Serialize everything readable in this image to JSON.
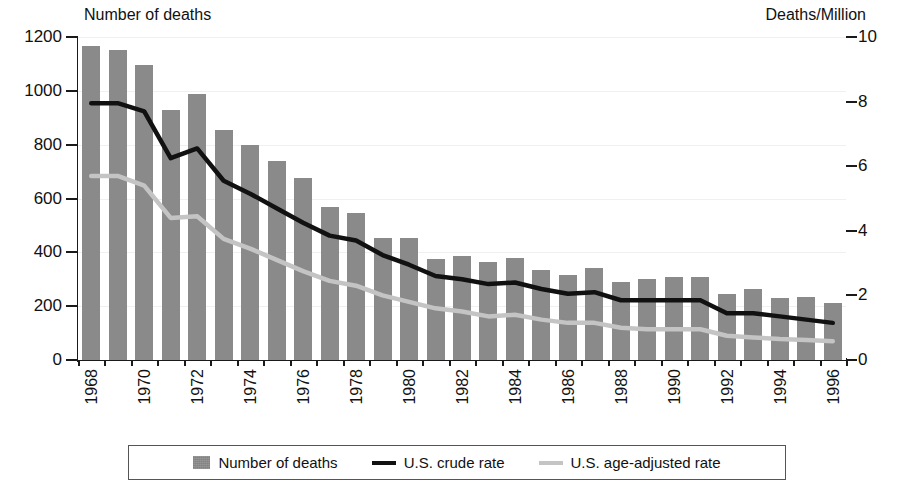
{
  "chart_data": {
    "type": "bar",
    "title": "",
    "left_axis_title": "Number of deaths",
    "right_axis_title": "Deaths/Million",
    "xlabel": "",
    "ylabel": "Number of deaths",
    "y2label": "Deaths/Million",
    "ylim": [
      0,
      1200
    ],
    "y2lim": [
      0,
      10
    ],
    "yticks": [
      0,
      200,
      400,
      600,
      800,
      1000,
      1200
    ],
    "y2ticks": [
      0,
      2,
      4,
      6,
      8,
      10
    ],
    "grid": false,
    "legend_position": "bottom",
    "categories": [
      "1968",
      "1969",
      "1970",
      "1971",
      "1972",
      "1973",
      "1974",
      "1975",
      "1976",
      "1977",
      "1978",
      "1979",
      "1980",
      "1981",
      "1982",
      "1983",
      "1984",
      "1985",
      "1986",
      "1987",
      "1988",
      "1989",
      "1990",
      "1991",
      "1992",
      "1993",
      "1994",
      "1995",
      "1996"
    ],
    "xtick_labels": [
      "1968",
      "1970",
      "1972",
      "1974",
      "1976",
      "1978",
      "1980",
      "1982",
      "1984",
      "1986",
      "1988",
      "1990",
      "1992",
      "1994",
      "1996"
    ],
    "series": [
      {
        "name": "Number of deaths",
        "type": "bar",
        "axis": "left",
        "color": "#8a8a8a",
        "values": [
          1165,
          1150,
          1095,
          930,
          990,
          855,
          800,
          740,
          675,
          570,
          545,
          455,
          455,
          375,
          385,
          365,
          380,
          335,
          315,
          340,
          290,
          300,
          310,
          310,
          245,
          265,
          230,
          235,
          210
        ]
      },
      {
        "name": "U.S. crude rate",
        "type": "line",
        "axis": "right",
        "color": "#111111",
        "values": [
          7.95,
          7.95,
          7.7,
          6.25,
          6.55,
          5.55,
          5.15,
          4.7,
          4.25,
          3.85,
          3.7,
          3.25,
          2.95,
          2.6,
          2.5,
          2.35,
          2.4,
          2.2,
          2.05,
          2.1,
          1.85,
          1.85,
          1.85,
          1.85,
          1.45,
          1.45,
          1.35,
          1.25,
          1.15
        ]
      },
      {
        "name": "U.S. age-adjusted rate",
        "type": "line",
        "axis": "right",
        "color": "#c4c4c4",
        "values": [
          5.7,
          5.7,
          5.4,
          4.4,
          4.45,
          3.75,
          3.45,
          3.1,
          2.75,
          2.45,
          2.3,
          2.0,
          1.8,
          1.6,
          1.5,
          1.35,
          1.4,
          1.25,
          1.15,
          1.15,
          1.0,
          0.95,
          0.95,
          0.95,
          0.75,
          0.7,
          0.65,
          0.62,
          0.58
        ]
      }
    ]
  },
  "legend": {
    "items": [
      {
        "label": "Number of deaths",
        "marker": "bar-swatch",
        "color": "#8a8a8a"
      },
      {
        "label": "U.S. crude rate",
        "marker": "line-swatch",
        "color": "#111111"
      },
      {
        "label": "U.S. age-adjusted rate",
        "marker": "line-swatch",
        "color": "#c4c4c4"
      }
    ]
  }
}
